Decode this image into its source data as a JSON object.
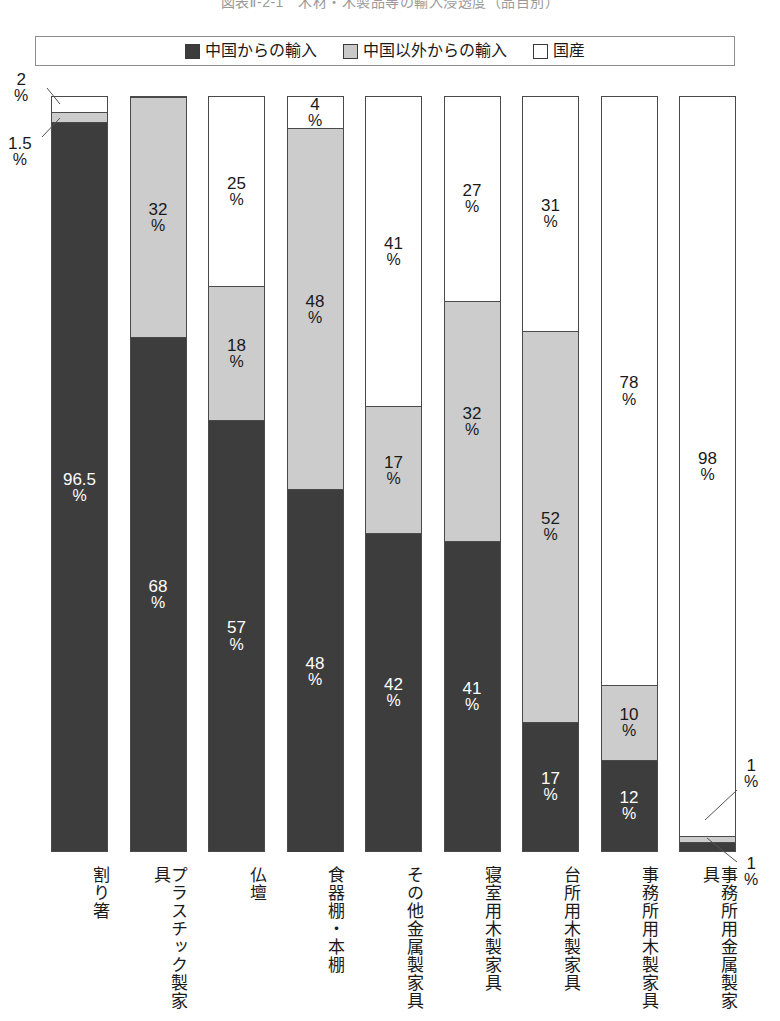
{
  "title": "図表Ⅱ-2-1　木材・木製品等の輸入浸透度（品目別）",
  "legend": {
    "items": [
      {
        "key": "china",
        "label": "中国からの輸入",
        "color": "#3d3d3d",
        "swatch": "filled-dark-square-icon"
      },
      {
        "key": "other",
        "label": "中国以外からの輸入",
        "color": "#cccccc",
        "swatch": "filled-gray-square-icon"
      },
      {
        "key": "domestic",
        "label": "国産",
        "color": "#ffffff",
        "swatch": "empty-square-icon"
      }
    ]
  },
  "callouts": [
    {
      "id": "c1",
      "value": "2",
      "unit": "%",
      "target": "bar1-domestic"
    },
    {
      "id": "c2",
      "value": "1.5",
      "unit": "%",
      "target": "bar1-other"
    },
    {
      "id": "c3",
      "value": "1",
      "unit": "%",
      "target": "bar9-other"
    },
    {
      "id": "c4",
      "value": "1",
      "unit": "%",
      "target": "bar9-china"
    }
  ],
  "chart_data": {
    "type": "bar",
    "subtype": "stacked-100-percent",
    "title": "図表Ⅱ-2-1　木材・木製品等の輸入浸透度（品目別）",
    "xlabel": "",
    "ylabel": "",
    "ylim": [
      0,
      100
    ],
    "grid": false,
    "legend_position": "top",
    "unit": "%",
    "categories": [
      "割り箸",
      "プラスチック製家具",
      "仏壇",
      "食器棚・本棚",
      "その他金属製家具",
      "寝室用木製家具",
      "台所用木製家具",
      "事務所用木製家具",
      "事務所用金属製家具"
    ],
    "series": [
      {
        "name": "中国からの輸入",
        "color": "#3d3d3d",
        "values": [
          96.5,
          68,
          57,
          48,
          42,
          41,
          17,
          12,
          1
        ]
      },
      {
        "name": "中国以外からの輸入",
        "color": "#cccccc",
        "values": [
          1.5,
          32,
          18,
          48,
          17,
          32,
          52,
          10,
          1
        ]
      },
      {
        "name": "国産",
        "color": "#ffffff",
        "values": [
          2,
          0,
          25,
          4,
          41,
          27,
          31,
          78,
          98
        ]
      }
    ]
  },
  "bars": [
    {
      "name": "割り箸",
      "segments": [
        {
          "type": "domestic",
          "value": 2,
          "label": "2",
          "unit": "%",
          "show_label": false
        },
        {
          "type": "other",
          "value": 1.5,
          "label": "1.5",
          "unit": "%",
          "show_label": false
        },
        {
          "type": "china",
          "value": 96.5,
          "label": "96.5",
          "unit": "%",
          "show_label": true
        }
      ]
    },
    {
      "name": "プラスチック製家具",
      "segments": [
        {
          "type": "domestic",
          "value": 0,
          "label": "",
          "unit": "",
          "show_label": false
        },
        {
          "type": "other",
          "value": 32,
          "label": "32",
          "unit": "%",
          "show_label": true
        },
        {
          "type": "china",
          "value": 68,
          "label": "68",
          "unit": "%",
          "show_label": true
        }
      ]
    },
    {
      "name": "仏壇",
      "segments": [
        {
          "type": "domestic",
          "value": 25,
          "label": "25",
          "unit": "%",
          "show_label": true
        },
        {
          "type": "other",
          "value": 18,
          "label": "18",
          "unit": "%",
          "show_label": true
        },
        {
          "type": "china",
          "value": 57,
          "label": "57",
          "unit": "%",
          "show_label": true
        }
      ]
    },
    {
      "name": "食器棚・本棚",
      "segments": [
        {
          "type": "domestic",
          "value": 4,
          "label": "4",
          "unit": "%",
          "show_label": true
        },
        {
          "type": "other",
          "value": 48,
          "label": "48",
          "unit": "%",
          "show_label": true
        },
        {
          "type": "china",
          "value": 48,
          "label": "48",
          "unit": "%",
          "show_label": true
        }
      ]
    },
    {
      "name": "その他金属製家具",
      "segments": [
        {
          "type": "domestic",
          "value": 41,
          "label": "41",
          "unit": "%",
          "show_label": true
        },
        {
          "type": "other",
          "value": 17,
          "label": "17",
          "unit": "%",
          "show_label": true
        },
        {
          "type": "china",
          "value": 42,
          "label": "42",
          "unit": "%",
          "show_label": true
        }
      ]
    },
    {
      "name": "寝室用木製家具",
      "segments": [
        {
          "type": "domestic",
          "value": 27,
          "label": "27",
          "unit": "%",
          "show_label": true
        },
        {
          "type": "other",
          "value": 32,
          "label": "32",
          "unit": "%",
          "show_label": true
        },
        {
          "type": "china",
          "value": 41,
          "label": "41",
          "unit": "%",
          "show_label": true
        }
      ]
    },
    {
      "name": "台所用木製家具",
      "segments": [
        {
          "type": "domestic",
          "value": 31,
          "label": "31",
          "unit": "%",
          "show_label": true
        },
        {
          "type": "other",
          "value": 52,
          "label": "52",
          "unit": "%",
          "show_label": true
        },
        {
          "type": "china",
          "value": 17,
          "label": "17",
          "unit": "%",
          "show_label": true
        }
      ]
    },
    {
      "name": "事務所用木製家具",
      "segments": [
        {
          "type": "domestic",
          "value": 78,
          "label": "78",
          "unit": "%",
          "show_label": true
        },
        {
          "type": "other",
          "value": 10,
          "label": "10",
          "unit": "%",
          "show_label": true
        },
        {
          "type": "china",
          "value": 12,
          "label": "12",
          "unit": "%",
          "show_label": true
        }
      ]
    },
    {
      "name": "事務所用金属製家具",
      "segments": [
        {
          "type": "domestic",
          "value": 98,
          "label": "98",
          "unit": "%",
          "show_label": true
        },
        {
          "type": "other",
          "value": 1,
          "label": "1",
          "unit": "%",
          "show_label": false
        },
        {
          "type": "china",
          "value": 1,
          "label": "1",
          "unit": "%",
          "show_label": false
        }
      ]
    }
  ],
  "xaxis_labels": [
    "割り箸",
    "プラスチック製家具",
    "仏壇",
    "食器棚・本棚",
    "その他金属製家具",
    "寝室用木製家具",
    "台所用木製家具",
    "事務所用木製家具",
    "事務所用金属製家具"
  ]
}
